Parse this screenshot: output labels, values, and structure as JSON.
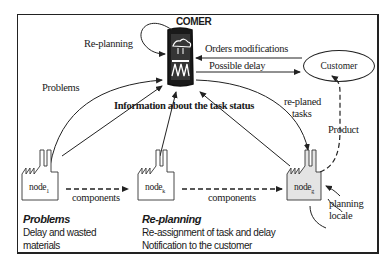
{
  "diagram": {
    "title": "COMER",
    "central_node": {
      "name": "COMER",
      "icon": "factory-cloud-icon"
    },
    "customer": {
      "label": "Customer"
    },
    "nodes": [
      {
        "name": "node",
        "subscript": "1"
      },
      {
        "name": "node",
        "subscript": "k"
      },
      {
        "name": "node",
        "subscript": "g"
      }
    ],
    "edge_labels": {
      "replanning_loop": "Re-planning",
      "problems": "Problems",
      "orders_modifications": "Orders modifications",
      "possible_delay": "Possible delay",
      "information": "Information about the task status",
      "replaned_tasks_line1": "re-planed",
      "replaned_tasks_line2": "tasks",
      "product": "Product",
      "components_1": "components",
      "components_2": "components",
      "planning_locale_line1": "planning",
      "planning_locale_line2": "locale"
    },
    "sections": [
      {
        "title": "Problems",
        "lines": [
          "Delay and wasted",
          "materials"
        ]
      },
      {
        "title": "Re-planning",
        "lines": [
          "Re-assignment of task and delay",
          "Notification to the customer"
        ]
      }
    ]
  }
}
